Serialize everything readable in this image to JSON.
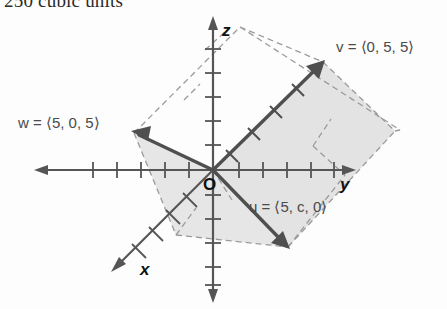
{
  "page": {
    "top_text": "250 cubic units"
  },
  "figure": {
    "name": "3d-vector-parallelepiped-diagram",
    "origin_label": "O",
    "axes": [
      {
        "id": "x",
        "label": "x"
      },
      {
        "id": "y",
        "label": "y"
      },
      {
        "id": "z",
        "label": "z"
      }
    ],
    "colors": {
      "axis": "#555555",
      "vector": "#4f4f4f",
      "dashed": "#9a9a9a",
      "shade": "#e2e2e2",
      "text": "#4a4a4a",
      "axis_label": "#111111"
    },
    "vectors": [
      {
        "id": "v",
        "name": "v",
        "components": "⟨0, 5, 5⟩",
        "label": "v = ⟨0, 5, 5⟩",
        "label_x": 336,
        "label_y": 52
      },
      {
        "id": "w",
        "name": "w",
        "components": "⟨5, 0, 5⟩",
        "label": "w = ⟨5, 0, 5⟩",
        "label_x": 18,
        "label_y": 128
      },
      {
        "id": "u",
        "name": "u",
        "components": "⟨5, c, 0⟩",
        "label": "u = ⟨5, c, 0⟩",
        "label_x": 249,
        "label_y": 212
      }
    ],
    "tick_count_z_up": 5,
    "tick_count_z_down": 6,
    "tick_count_y_pos": 5,
    "tick_count_y_neg": 5,
    "tick_count_x": 4
  }
}
